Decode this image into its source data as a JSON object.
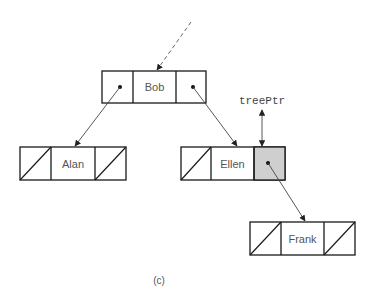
{
  "diagram": {
    "type": "binary-search-tree-linked-nodes",
    "nodes": [
      {
        "id": "bob",
        "label": "Bob",
        "left": "pointer",
        "right": "pointer"
      },
      {
        "id": "alan",
        "label": "Alan",
        "left": "null",
        "right": "null"
      },
      {
        "id": "ellen",
        "label": "Ellen",
        "left": "null",
        "right": "pointer-shaded"
      },
      {
        "id": "frank",
        "label": "Frank",
        "left": "null",
        "right": "null"
      }
    ],
    "edges": [
      {
        "from": "bob.left",
        "to": "alan"
      },
      {
        "from": "bob.right",
        "to": "ellen"
      },
      {
        "from": "ellen.right",
        "to": "frank"
      }
    ],
    "incoming_dashed_edge": {
      "to": "bob"
    },
    "pointer_label": "treePtr",
    "pointer_target": "ellen.right",
    "caption": "(c)",
    "colors": {
      "shaded_cell": "#cfcfcf",
      "lines": "#1a1a1a",
      "text": "#555555"
    }
  }
}
